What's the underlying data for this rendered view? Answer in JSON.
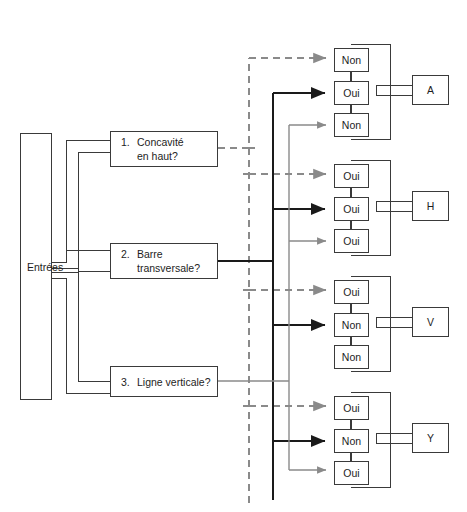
{
  "diagram": {
    "input": {
      "label": "Entrées"
    },
    "questions": [
      {
        "number": "1.",
        "line1": "Concavité",
        "line2": "en haut?"
      },
      {
        "number": "2.",
        "line1": "Barre",
        "line2": "transversale?"
      },
      {
        "number": "3.",
        "line1": "Ligne verticale?",
        "line2": ""
      }
    ],
    "groups": [
      {
        "letter": "A",
        "answers": [
          {
            "value": "Non",
            "source_question": "1.",
            "edge": "dashed-gray"
          },
          {
            "value": "Oui",
            "source_question": "2.",
            "edge": "solid-black"
          },
          {
            "value": "Non",
            "source_question": "3.",
            "edge": "solid-gray"
          }
        ]
      },
      {
        "letter": "H",
        "answers": [
          {
            "value": "Oui",
            "source_question": "1.",
            "edge": "dashed-gray"
          },
          {
            "value": "Oui",
            "source_question": "2.",
            "edge": "solid-black"
          },
          {
            "value": "Oui",
            "source_question": "3.",
            "edge": "solid-gray"
          }
        ]
      },
      {
        "letter": "V",
        "answers": [
          {
            "value": "Oui",
            "source_question": "1.",
            "edge": "dashed-gray"
          },
          {
            "value": "Non",
            "source_question": "2.",
            "edge": "solid-black"
          },
          {
            "value": "Non",
            "source_question": "3.",
            "edge": "none"
          }
        ]
      },
      {
        "letter": "Y",
        "answers": [
          {
            "value": "Oui",
            "source_question": "1.",
            "edge": "dashed-gray"
          },
          {
            "value": "Non",
            "source_question": "2.",
            "edge": "solid-black"
          },
          {
            "value": "Oui",
            "source_question": "3.",
            "edge": "solid-gray"
          }
        ]
      }
    ],
    "colors": {
      "stroke_dark": "#3a3a3a",
      "stroke_gray": "#8a8a8a",
      "stroke_black": "#1a1a1a",
      "background": "#ffffff",
      "text": "#1d1d1d"
    }
  }
}
